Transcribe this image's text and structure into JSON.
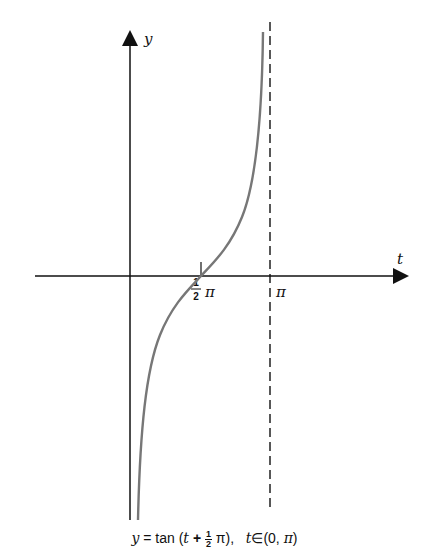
{
  "diagram": {
    "axes": {
      "vertical_label": "y",
      "horizontal_label": "t"
    },
    "ticks": [
      {
        "label_num": "1",
        "label_den": "2",
        "label_sym": "π",
        "value": "½π"
      },
      {
        "label_sym": "π",
        "value": "π"
      }
    ],
    "asymptote": {
      "at": "t = π",
      "style": "dashed"
    },
    "curve": {
      "function": "y = tan(t + ½π)",
      "domain": "(0, π)",
      "color": "#777777"
    },
    "caption": {
      "y": "y",
      "eq": " = tan (",
      "t1": "t",
      "plus": " + ",
      "frac_num": "1",
      "frac_den": "2",
      "pi1": " π), ",
      "t2": "t",
      "in": "∈(0, ",
      "pi2": "π",
      "close": ")"
    }
  }
}
